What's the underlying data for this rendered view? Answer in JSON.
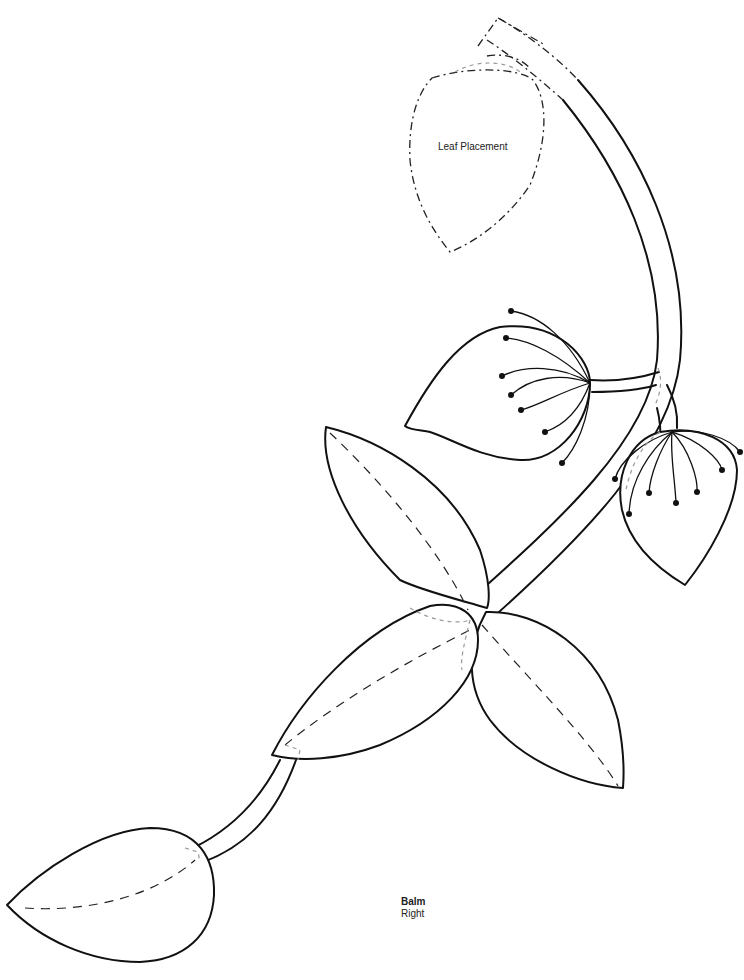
{
  "pattern": {
    "name": "Balm",
    "orientation": "Right"
  },
  "annotations": {
    "leaf_placement": "Leaf Placement"
  },
  "colors": {
    "line": "#111111",
    "placement_guide": "#222222",
    "hidden_edge": "#9a9a9a",
    "background": "#ffffff"
  },
  "elements": {
    "stem": "main curved stem",
    "flower_buds": 2,
    "leaves": 5,
    "placement_outline": 1
  }
}
